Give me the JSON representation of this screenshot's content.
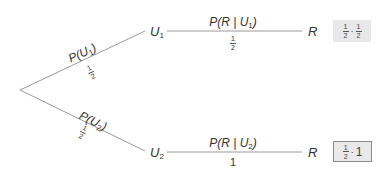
{
  "diagram": {
    "type": "probability-tree",
    "line_color": "#9a9a9a",
    "root": {
      "label": ""
    },
    "branches": [
      {
        "edge_label": "P(U",
        "edge_sub": "1",
        "edge_close": ")",
        "edge_prob": {
          "num": "1",
          "den": "2"
        },
        "node": {
          "label": "U",
          "sub": "1"
        },
        "next_edge": {
          "label": "P(R | U",
          "sub": "1",
          "close": ")",
          "prob_num": "1",
          "prob_den": "2"
        },
        "leaf": {
          "label": "R"
        },
        "product": {
          "a_num": "1",
          "a_den": "2",
          "dot": "·",
          "b_num": "1",
          "b_den": "2",
          "b_text": ""
        },
        "box_style": "shaded"
      },
      {
        "edge_label": "P(U",
        "edge_sub": "2",
        "edge_close": ")",
        "edge_prob": {
          "num": "1",
          "den": "2"
        },
        "node": {
          "label": "U",
          "sub": "2"
        },
        "next_edge": {
          "label": "P(R | U",
          "sub": "2",
          "close": ")",
          "prob": "1"
        },
        "leaf": {
          "label": "R"
        },
        "product": {
          "a_num": "1",
          "a_den": "2",
          "dot": "·",
          "b_text": "1"
        },
        "box_style": "bordered"
      }
    ]
  }
}
